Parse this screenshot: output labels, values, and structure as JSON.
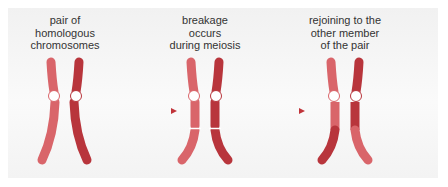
{
  "figure": {
    "stages": [
      {
        "label_lines": [
          "pair of",
          "homologous",
          "chromosomes"
        ]
      },
      {
        "label_lines": [
          "breakage",
          "occurs",
          "during meiosis"
        ]
      },
      {
        "label_lines": [
          "rejoining to the",
          "other member",
          "of the pair"
        ]
      }
    ],
    "colors": {
      "chromosome_a": "#d9656a",
      "chromosome_b": "#b8353c",
      "centromere": "#ffffff",
      "arrow": "#c0343a",
      "background": "#f5f5f5"
    }
  }
}
